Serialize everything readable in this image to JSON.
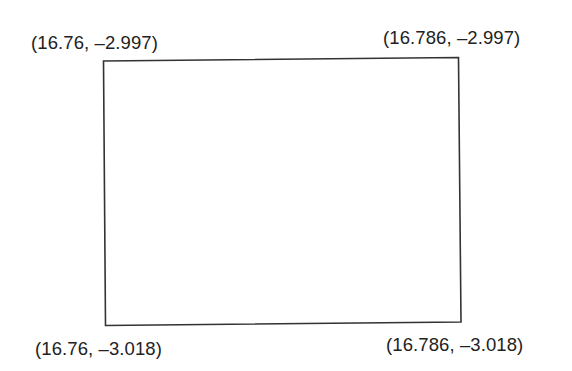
{
  "diagram": {
    "type": "bounding-box",
    "stroke_color": "#333333",
    "label_color": "#222222",
    "corners": {
      "top_left": {
        "label": "(16.76, –2.997)",
        "x": 16.76,
        "y": -2.997
      },
      "top_right": {
        "label": "(16.786, –2.997)",
        "x": 16.786,
        "y": -2.997
      },
      "bottom_left": {
        "label": "(16.76, –3.018)",
        "x": 16.76,
        "y": -3.018
      },
      "bottom_right": {
        "label": "(16.786, –3.018)",
        "x": 16.786,
        "y": -3.018
      }
    }
  }
}
